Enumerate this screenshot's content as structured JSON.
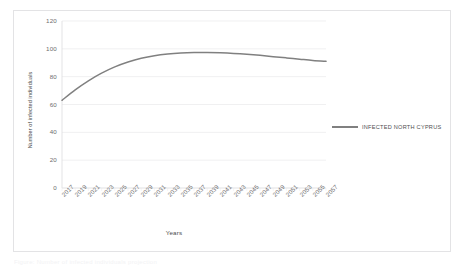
{
  "figure": {
    "caption": "Figure: Number of infected individuals projection"
  },
  "legend": {
    "position": "right",
    "entries": [
      {
        "label": "INFECTED NORTH CYPRUS",
        "color": "#808080"
      }
    ]
  },
  "chart_data": {
    "type": "line",
    "title": "",
    "xlabel": "Years",
    "ylabel": "Number of infected individuals",
    "ylim": [
      0,
      120
    ],
    "yticks": [
      0,
      20,
      40,
      60,
      80,
      100,
      120
    ],
    "grid": true,
    "categories": [
      "2017",
      "2019",
      "2021",
      "2023",
      "2025",
      "2027",
      "2029",
      "2031",
      "2033",
      "2035",
      "2037",
      "2039",
      "2041",
      "2043",
      "2045",
      "2047",
      "2049",
      "2051",
      "2053",
      "2055",
      "2057"
    ],
    "series": [
      {
        "name": "INFECTED NORTH CYPRUS",
        "color": "#808080",
        "values": [
          63.0,
          70.5,
          77.0,
          82.5,
          87.0,
          90.5,
          93.2,
          95.1,
          96.3,
          97.0,
          97.3,
          97.3,
          97.1,
          96.7,
          96.1,
          95.3,
          94.4,
          93.5,
          92.6,
          91.7,
          91.0
        ]
      }
    ]
  }
}
